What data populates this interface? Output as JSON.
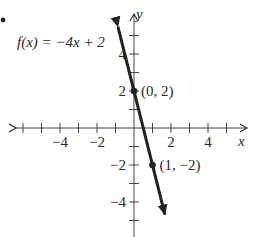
{
  "chart_data": {
    "type": "line",
    "title": "",
    "function_label": "f(x) = −4x + 2",
    "xlabel": "x",
    "ylabel": "y",
    "xlim": [
      -6.5,
      5.8
    ],
    "ylim": [
      -5.5,
      6.3
    ],
    "x_ticks": [
      -6,
      -5,
      -4,
      -3,
      -2,
      -1,
      1,
      2,
      3,
      4,
      5
    ],
    "x_tick_labels": [
      "−4",
      "−2",
      "2",
      "4"
    ],
    "x_tick_label_values": [
      -4,
      -2,
      2,
      4
    ],
    "y_ticks": [
      -5,
      -4,
      -3,
      -2,
      -1,
      1,
      2,
      3,
      4,
      5
    ],
    "y_tick_labels": [
      "4",
      "2",
      "−2",
      "−4"
    ],
    "y_tick_label_values": [
      4,
      2,
      -2,
      -4
    ],
    "grid": false,
    "series": [
      {
        "name": "f(x) = −4x + 2",
        "slope": -4,
        "intercept": 2,
        "x": [
          -0.87,
          1.67
        ],
        "y": [
          5.48,
          -4.68
        ]
      }
    ],
    "points": [
      {
        "x": 0,
        "y": 2,
        "label": "(0, 2)"
      },
      {
        "x": 1,
        "y": -2,
        "label": "(1, −2)"
      }
    ],
    "bullet": "•"
  }
}
